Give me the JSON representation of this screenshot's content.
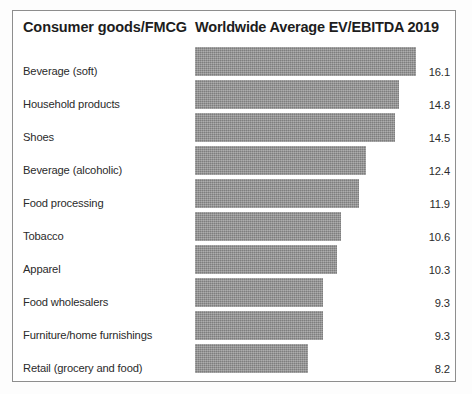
{
  "header": {
    "category_header": "Consumer goods/FMCG",
    "value_header": "Worldwide Average EV/EBITDA 2019"
  },
  "colors": {
    "bar_fill": "#8d8d8d",
    "frame_border": "#8e8e8e",
    "text": "#2b2b2b",
    "header_text": "#1d1d1d",
    "background": "#ffffff"
  },
  "chart_data": {
    "type": "bar",
    "orientation": "horizontal",
    "title": "Worldwide Average EV/EBITDA 2019",
    "xlabel": "",
    "ylabel": "Consumer goods/FMCG",
    "xlim": [
      0,
      16.1
    ],
    "grid": false,
    "legend": null,
    "value_labels_shown": true,
    "categories": [
      "Beverage (soft)",
      "Household products",
      "Shoes",
      "Beverage (alcoholic)",
      "Food processing",
      "Tobacco",
      "Apparel",
      "Food wholesalers",
      "Furniture/home furnishings",
      "Retail (grocery and food)"
    ],
    "values": [
      16.1,
      14.8,
      14.5,
      12.4,
      11.9,
      10.6,
      10.3,
      9.3,
      9.3,
      8.2
    ],
    "value_labels": [
      "16.1",
      "14.8",
      "14.5",
      "12.4",
      "11.9",
      "10.6",
      "10.3",
      "9.3",
      "9.3",
      "8.2"
    ],
    "rows": [
      {
        "label": "Beverage (soft)",
        "value": 16.1,
        "value_label": "16.1",
        "bar_pct": 100.0
      },
      {
        "label": "Household products",
        "value": 14.8,
        "value_label": "14.8",
        "bar_pct": 92.1
      },
      {
        "label": "Shoes",
        "value": 14.5,
        "value_label": "14.5",
        "bar_pct": 90.2
      },
      {
        "label": "Beverage (alcoholic)",
        "value": 12.4,
        "value_label": "12.4",
        "bar_pct": 77.1
      },
      {
        "label": "Food processing",
        "value": 11.9,
        "value_label": "11.9",
        "bar_pct": 74.0
      },
      {
        "label": "Tobacco",
        "value": 10.6,
        "value_label": "10.6",
        "bar_pct": 65.9
      },
      {
        "label": "Apparel",
        "value": 10.3,
        "value_label": "10.3",
        "bar_pct": 64.0
      },
      {
        "label": "Food wholesalers",
        "value": 9.3,
        "value_label": "9.3",
        "bar_pct": 57.8
      },
      {
        "label": "Furniture/home furnishings",
        "value": 9.3,
        "value_label": "9.3",
        "bar_pct": 57.8
      },
      {
        "label": "Retail (grocery and food)",
        "value": 8.2,
        "value_label": "8.2",
        "bar_pct": 51.0
      }
    ]
  }
}
